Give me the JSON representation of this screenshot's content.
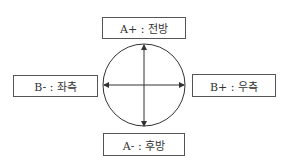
{
  "diagram": {
    "boxes": {
      "top": {
        "label": "A+ : 전방"
      },
      "left": {
        "label": "B- : 좌측"
      },
      "right": {
        "label": "B+ : 우측"
      },
      "bottom": {
        "label": "A- : 후방"
      }
    },
    "circle": {
      "arrows": [
        "up",
        "down",
        "left",
        "right"
      ]
    },
    "colors": {
      "line": "#333333",
      "border": "#555555"
    }
  }
}
